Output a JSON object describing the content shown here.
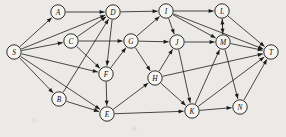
{
  "figure": {
    "type": "directed-graph",
    "title": "",
    "background_color": "#eceae6",
    "node_fill": "#f6f5f2",
    "stroke_color": "#1c1c1c",
    "node_radius": 7.2,
    "width": 286,
    "height": 137
  },
  "nodes": [
    {
      "id": "S",
      "label": "S",
      "x": 14,
      "y": 52
    },
    {
      "id": "A",
      "label": "A",
      "x": 58,
      "y": 12
    },
    {
      "id": "B",
      "label": "B",
      "x": 59,
      "y": 99
    },
    {
      "id": "C",
      "label": "C",
      "x": 71,
      "y": 41
    },
    {
      "id": "D",
      "label": "D",
      "x": 113,
      "y": 12
    },
    {
      "id": "E",
      "label": "E",
      "x": 107,
      "y": 114
    },
    {
      "id": "F",
      "label": "F",
      "x": 106,
      "y": 74
    },
    {
      "id": "G",
      "label": "G",
      "x": 131,
      "y": 41
    },
    {
      "id": "H",
      "label": "H",
      "x": 155,
      "y": 78
    },
    {
      "id": "I",
      "label": "I",
      "x": 166,
      "y": 11
    },
    {
      "id": "J",
      "label": "J",
      "x": 177,
      "y": 42
    },
    {
      "id": "K",
      "label": "K",
      "x": 192,
      "y": 111
    },
    {
      "id": "L",
      "label": "L",
      "x": 222,
      "y": 11
    },
    {
      "id": "M",
      "label": "M",
      "x": 223,
      "y": 42
    },
    {
      "id": "N",
      "label": "N",
      "x": 240,
      "y": 107
    },
    {
      "id": "T",
      "label": "T",
      "x": 271,
      "y": 52
    }
  ],
  "edges": [
    {
      "from": "S",
      "to": "A"
    },
    {
      "from": "S",
      "to": "C"
    },
    {
      "from": "S",
      "to": "D"
    },
    {
      "from": "S",
      "to": "F"
    },
    {
      "from": "S",
      "to": "B"
    },
    {
      "from": "S",
      "to": "E"
    },
    {
      "from": "A",
      "to": "D"
    },
    {
      "from": "B",
      "to": "D"
    },
    {
      "from": "B",
      "to": "E"
    },
    {
      "from": "C",
      "to": "D"
    },
    {
      "from": "C",
      "to": "F"
    },
    {
      "from": "C",
      "to": "G"
    },
    {
      "from": "D",
      "to": "I"
    },
    {
      "from": "D",
      "to": "F"
    },
    {
      "from": "E",
      "to": "H"
    },
    {
      "from": "E",
      "to": "K"
    },
    {
      "from": "F",
      "to": "G"
    },
    {
      "from": "F",
      "to": "E"
    },
    {
      "from": "G",
      "to": "I"
    },
    {
      "from": "G",
      "to": "J"
    },
    {
      "from": "G",
      "to": "H"
    },
    {
      "from": "H",
      "to": "J"
    },
    {
      "from": "H",
      "to": "K"
    },
    {
      "from": "H",
      "to": "T"
    },
    {
      "from": "I",
      "to": "L"
    },
    {
      "from": "I",
      "to": "J"
    },
    {
      "from": "I",
      "to": "M"
    },
    {
      "from": "I",
      "to": "T"
    },
    {
      "from": "J",
      "to": "M"
    },
    {
      "from": "J",
      "to": "K"
    },
    {
      "from": "K",
      "to": "M"
    },
    {
      "from": "K",
      "to": "N"
    },
    {
      "from": "K",
      "to": "T"
    },
    {
      "from": "L",
      "to": "T"
    },
    {
      "from": "L",
      "to": "M"
    },
    {
      "from": "M",
      "to": "L"
    },
    {
      "from": "M",
      "to": "N"
    },
    {
      "from": "M",
      "to": "T"
    },
    {
      "from": "N",
      "to": "T"
    }
  ]
}
